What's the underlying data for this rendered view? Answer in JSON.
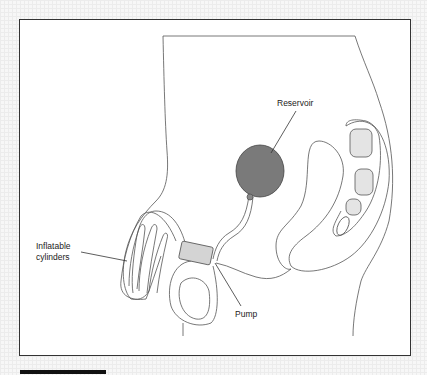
{
  "figure": {
    "labels": {
      "reservoir": "Reservoir",
      "cylinders": "Inflatable\ncylinders",
      "pump": "Pump"
    },
    "colors": {
      "reservoir_fill": "#7a7a7a",
      "pump_fill": "#d4d4d4",
      "bone_fill": "#e4e4e4",
      "outline": "#555555",
      "frame_border": "#333333"
    }
  }
}
